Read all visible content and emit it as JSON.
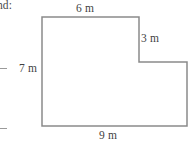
{
  "page": {
    "width": 196,
    "height": 147,
    "background_color": "#ffffff",
    "cropped_text_fragment": "nd:"
  },
  "figure": {
    "name": "l-shaped-polygon",
    "stroke_color": "#8a8a8a",
    "fill_color": "#ffffff",
    "stroke_width": 1.5,
    "shape": "L-shape (rectangle with notch cut from top-right)",
    "points_px": "42,17 139,17 139,62 187,62 187,126 42,126",
    "labels": {
      "top": "6 m",
      "right_step": "3 m",
      "left": "7 m",
      "bottom": "9 m"
    }
  },
  "margin_marks": {
    "upper_dash": "—",
    "lower_dash": "—",
    "color": "#9a9a9a"
  },
  "chart_data": {
    "type": "diagram",
    "title": "",
    "shape": "l-shape-polygon",
    "unit": "m",
    "vertices": [
      [
        0,
        7
      ],
      [
        6,
        7
      ],
      [
        6,
        4
      ],
      [
        9,
        4
      ],
      [
        9,
        0
      ],
      [
        0,
        0
      ]
    ],
    "edge_labels": [
      {
        "edge": "top",
        "value": 6,
        "text": "6 m",
        "position": "above-top-edge"
      },
      {
        "edge": "step-vertical",
        "value": 3,
        "text": "3 m",
        "position": "right-of-step"
      },
      {
        "edge": "left",
        "value": 7,
        "text": "7 m",
        "position": "left-of-left-edge"
      },
      {
        "edge": "bottom",
        "value": 9,
        "text": "9 m",
        "position": "below-bottom-edge"
      }
    ],
    "grid": false,
    "legend": "none"
  }
}
